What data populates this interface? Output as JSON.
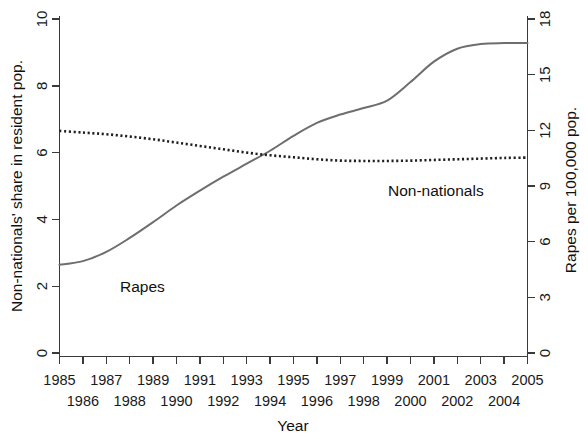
{
  "chart_data": {
    "type": "line",
    "title": "",
    "xlabel": "Year",
    "ylabel": "Non-nationals' share in resident pop.",
    "y2label": "Rapes per 100,000 pop.",
    "grid": false,
    "legend_position": "inline-annotations",
    "xlim": [
      1985,
      2005
    ],
    "ylim": [
      0,
      10
    ],
    "y2lim": [
      0,
      18
    ],
    "x": [
      1985,
      1986,
      1987,
      1988,
      1989,
      1990,
      1991,
      1992,
      1993,
      1994,
      1995,
      1996,
      1997,
      1998,
      1999,
      2000,
      2001,
      2002,
      2003,
      2004,
      2005
    ],
    "xticks_top_row": [
      "1985",
      "1987",
      "1989",
      "1991",
      "1993",
      "1995",
      "1997",
      "1999",
      "2001",
      "2003",
      "2005"
    ],
    "xticks_bottom_row": [
      "1986",
      "1988",
      "1990",
      "1992",
      "1994",
      "1996",
      "1998",
      "2000",
      "2002",
      "2004"
    ],
    "yticks": [
      "0",
      "2",
      "4",
      "6",
      "8",
      "10"
    ],
    "y2ticks": [
      "0",
      "3",
      "6",
      "9",
      "12",
      "15",
      "18"
    ],
    "series": [
      {
        "name": "Rapes",
        "axis": "right",
        "style": "solid",
        "color": "#6e6e6e",
        "label_text": "Rapes",
        "values": [
          4.75,
          4.95,
          5.45,
          6.2,
          7.05,
          7.95,
          8.75,
          9.5,
          10.2,
          10.9,
          11.7,
          12.4,
          12.85,
          13.2,
          13.6,
          14.6,
          15.7,
          16.4,
          16.65,
          16.7,
          16.7
        ]
      },
      {
        "name": "Non-nationals",
        "axis": "left",
        "style": "dotted",
        "color": "#1f1f1f",
        "label_text": "Non-nationals",
        "values": [
          6.65,
          6.6,
          6.55,
          6.48,
          6.4,
          6.3,
          6.2,
          6.1,
          6.0,
          5.92,
          5.86,
          5.8,
          5.76,
          5.75,
          5.75,
          5.76,
          5.78,
          5.8,
          5.82,
          5.84,
          5.85
        ]
      }
    ],
    "annotations": [
      {
        "text": "Rapes",
        "x_px": 120,
        "y_px": 288
      },
      {
        "text": "Non-nationals",
        "x_px": 388,
        "y_px": 192
      }
    ]
  },
  "axes": {
    "left_title": "Non-nationals' share in resident pop.",
    "right_title": "Rapes per 100,000 pop.",
    "bottom_title": "Year"
  }
}
